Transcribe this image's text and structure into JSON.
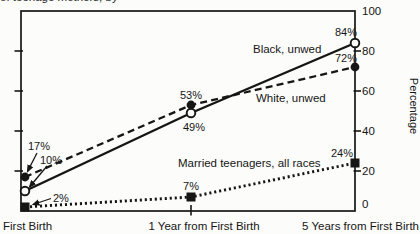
{
  "caption": {
    "visible_fragment": "of teenage mothers, by"
  },
  "chart_data": {
    "type": "line",
    "categories": [
      "First Birth",
      "1 Year from First Birth",
      "5 Years from First Birth"
    ],
    "series": [
      {
        "name": "Black, unwed",
        "line_style": "solid",
        "marker": "open-circle",
        "values": [
          10,
          49,
          84
        ],
        "point_labels": [
          "10%",
          "49%",
          "84%"
        ]
      },
      {
        "name": "White, unwed",
        "line_style": "dashed",
        "marker": "filled-circle",
        "values": [
          17,
          53,
          72
        ],
        "point_labels": [
          "17%",
          "53%",
          "72%"
        ]
      },
      {
        "name": "Married teenagers, all races",
        "line_style": "dotted",
        "marker": "filled-square",
        "values": [
          2,
          7,
          24
        ],
        "point_labels": [
          "2%",
          "7%",
          "24%"
        ]
      }
    ],
    "ylabel": "Percentage",
    "ylim": [
      0,
      100
    ],
    "yticks": [
      0,
      20,
      40,
      60,
      80,
      100
    ],
    "grid": false,
    "legend_position": "inline-annotations",
    "ink_color": "#161616",
    "background": "#fcfcfa"
  }
}
